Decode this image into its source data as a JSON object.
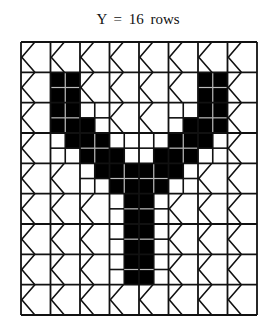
{
  "title": "Y = 16 rows",
  "grid": {
    "coarse_cols": 8,
    "coarse_rows": 9,
    "fine_per_coarse": 2,
    "origin_x": 21,
    "origin_y": 42,
    "width": 236,
    "height": 273,
    "line_color": "#111111",
    "fill_color": "#000000",
    "fine_line_color": "#bbbbbb"
  },
  "black_cells": {
    "2": [
      2,
      3,
      12,
      13
    ],
    "3": [
      2,
      3,
      12,
      13
    ],
    "4": [
      2,
      3,
      12,
      13
    ],
    "5": [
      2,
      3,
      4,
      11,
      12,
      13
    ],
    "6": [
      3,
      4,
      5,
      10,
      11,
      12
    ],
    "7": [
      4,
      5,
      6,
      9,
      10,
      11
    ],
    "8": [
      5,
      6,
      7,
      8,
      9,
      10
    ],
    "9": [
      6,
      7,
      8,
      9
    ],
    "10": [
      7,
      8
    ],
    "11": [
      7,
      8
    ],
    "12": [
      7,
      8
    ],
    "13": [
      7,
      8
    ],
    "14": [
      7,
      8
    ],
    "15": [
      7,
      8
    ]
  },
  "subdivided_coarse_cells": [
    [
      1,
      1
    ],
    [
      1,
      6
    ],
    [
      2,
      1
    ],
    [
      2,
      2
    ],
    [
      2,
      5
    ],
    [
      2,
      6
    ],
    [
      3,
      1
    ],
    [
      3,
      2
    ],
    [
      3,
      3
    ],
    [
      3,
      4
    ],
    [
      3,
      5
    ],
    [
      3,
      6
    ],
    [
      4,
      2
    ],
    [
      4,
      3
    ],
    [
      4,
      4
    ],
    [
      4,
      5
    ],
    [
      5,
      3
    ],
    [
      5,
      4
    ],
    [
      6,
      3
    ],
    [
      6,
      4
    ],
    [
      7,
      3
    ],
    [
      7,
      4
    ]
  ],
  "empty_cell_glyph": "chevron-left"
}
